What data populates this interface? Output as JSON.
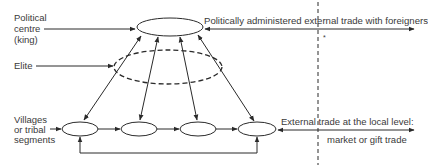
{
  "diagram": {
    "labels": {
      "political_centre_1": "Political",
      "political_centre_2": "centre",
      "political_centre_3": "(king)",
      "elite": "Elite",
      "villages_1": "Villages",
      "villages_2": "or tribal",
      "villages_3": "segments",
      "top_trade": "Politically administered external trade with foreigners",
      "bottom_trade_1": "External trade at the local level:",
      "bottom_trade_2": "market or gift trade",
      "marker": "*"
    },
    "colors": {
      "stroke": "#2a2a2a",
      "text": "#3a3a3a",
      "background": "#ffffff"
    },
    "nodes": {
      "king": {
        "cx": 170,
        "cy": 27,
        "rx": 33,
        "ry": 9
      },
      "elite": {
        "cx": 168,
        "cy": 67,
        "rx": 54,
        "ry": 17,
        "dashed": true
      },
      "villages": [
        {
          "cx": 80,
          "cy": 129,
          "rx": 18,
          "ry": 7
        },
        {
          "cx": 139,
          "cy": 129,
          "rx": 18,
          "ry": 7
        },
        {
          "cx": 198,
          "cy": 129,
          "rx": 18,
          "ry": 7
        },
        {
          "cx": 257,
          "cy": 129,
          "rx": 19,
          "ry": 7
        }
      ]
    }
  }
}
